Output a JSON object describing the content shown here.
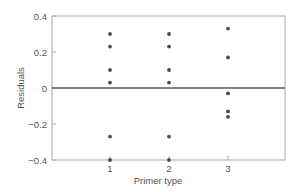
{
  "chart_data": {
    "type": "scatter",
    "title": "",
    "xlabel": "Primer type",
    "ylabel": "Residuals",
    "x_ticks": [
      1,
      2,
      3
    ],
    "x_tick_labels": [
      "1",
      "2",
      "3"
    ],
    "y_ticks": [
      0.4,
      0.2,
      0,
      -0.2,
      -0.4
    ],
    "y_tick_labels": [
      "0.4",
      "0.2",
      "0",
      "−0.2",
      "−0.4"
    ],
    "xlim": [
      0.3,
      4.0
    ],
    "ylim": [
      -0.4,
      0.4
    ],
    "grid": false,
    "reference_line": {
      "y": 0
    },
    "series": [
      {
        "name": "Residuals",
        "points": [
          {
            "x": 1,
            "y": 0.3
          },
          {
            "x": 1,
            "y": 0.23
          },
          {
            "x": 1,
            "y": 0.1
          },
          {
            "x": 1,
            "y": 0.03
          },
          {
            "x": 1,
            "y": -0.27
          },
          {
            "x": 1,
            "y": -0.4
          },
          {
            "x": 2,
            "y": 0.3
          },
          {
            "x": 2,
            "y": 0.23
          },
          {
            "x": 2,
            "y": 0.1
          },
          {
            "x": 2,
            "y": 0.03
          },
          {
            "x": 2,
            "y": -0.27
          },
          {
            "x": 2,
            "y": -0.4
          },
          {
            "x": 3,
            "y": 0.33
          },
          {
            "x": 3,
            "y": 0.17
          },
          {
            "x": 3,
            "y": -0.03
          },
          {
            "x": 3,
            "y": -0.13
          },
          {
            "x": 3,
            "y": -0.16
          }
        ]
      }
    ],
    "colors": {
      "points": "#4a4a4a",
      "frame": "#a0a0a0",
      "zero_line": "#5a5a5a",
      "text": "#555555"
    }
  }
}
